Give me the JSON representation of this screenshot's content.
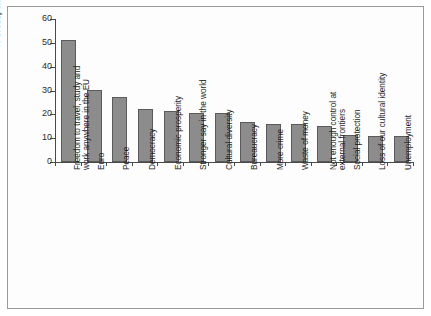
{
  "chart_data": {
    "type": "bar",
    "title": "",
    "subtitle": "",
    "xlabel": "",
    "ylabel": "% of respondents",
    "ylim": [
      0,
      60
    ],
    "yticks": [
      0,
      10,
      20,
      30,
      40,
      50,
      60
    ],
    "ytick_labels": [
      "0",
      "10",
      "20",
      "30",
      "40",
      "50",
      "60"
    ],
    "grid": false,
    "legend": null,
    "bar_color": "#8c8c8c",
    "bar_edge_color": "#5a5a5a",
    "axis_color": "#4a4a4a",
    "frame_color": "#9a9a9a",
    "categories": [
      "Freedom to travel, study and work anywhere in the EU",
      "Euro",
      "Peace",
      "Democracy",
      "Economic prosperity",
      "Stronger say in the world",
      "Cultural diversity",
      "Bureaucracy",
      "More crime",
      "Waste of money",
      "Not enough control at external frontiers",
      "Social protection",
      "Loss of our cultural identity",
      "Unemployment"
    ],
    "category_lines": [
      [
        "Freedom to travel, study and",
        "work anywhere in the EU"
      ],
      [
        "Euro"
      ],
      [
        "Peace"
      ],
      [
        "Democracy"
      ],
      [
        "Economic prosperity"
      ],
      [
        "Stronger say in the world"
      ],
      [
        "Cultural diversity"
      ],
      [
        "Bureaucracy"
      ],
      [
        "More crime"
      ],
      [
        "Waste of money"
      ],
      [
        "Not enough control at",
        "external frontiers"
      ],
      [
        "Social protection"
      ],
      [
        "Loss of our cultural identity"
      ],
      [
        "Unemployment"
      ]
    ],
    "values": [
      51,
      30.3,
      27.4,
      22.3,
      21.6,
      20.6,
      20.5,
      16.6,
      15.9,
      15.8,
      15.0,
      11.4,
      10.8,
      11.0
    ]
  }
}
